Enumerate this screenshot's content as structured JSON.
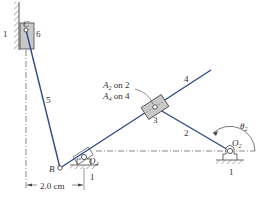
{
  "diagram": {
    "colors": {
      "link": "#2f4a8a",
      "ground": "#555555",
      "block_fill": "#c8c8c8",
      "text": "#333333"
    },
    "labels": {
      "ground_left": "1",
      "slider_c_letter": "C",
      "slider_c_number": "6",
      "link_5": "5",
      "point_b": "B",
      "pivot_o4": "O",
      "pivot_o4_sub": "4",
      "ground_o4": "1",
      "dimension": "2.0 cm",
      "coincident_a2": "A",
      "coincident_a2_sub": "2",
      "coincident_a2_tail": " on 2",
      "coincident_a4": "A",
      "coincident_a4_sub": "4",
      "coincident_a4_tail": " on 4",
      "link_4": "4",
      "block_3": "3",
      "link_2": "2",
      "pivot_o2": "O",
      "pivot_o2_sub": "2",
      "ground_o2": "1",
      "angle": "θ",
      "angle_sub": "2"
    }
  }
}
